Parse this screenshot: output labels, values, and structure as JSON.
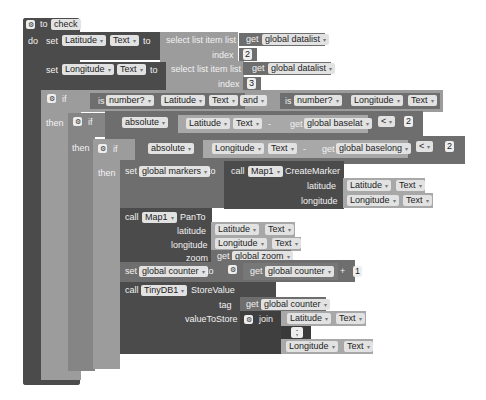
{
  "procedure": {
    "to_label": "to",
    "name": "check",
    "do_label": "do"
  },
  "set_latitude": {
    "set_label": "set",
    "component": "Latitude",
    "property": "Text",
    "to_label": "to",
    "select_label": "select list item  list",
    "get_label": "get",
    "list_var": "global datalist",
    "index_label": "index",
    "index_value": "2"
  },
  "set_longitude": {
    "set_label": "set",
    "component": "Longitude",
    "property": "Text",
    "to_label": "to",
    "select_label": "select list item  list",
    "get_label": "get",
    "list_var": "global datalist",
    "index_label": "index",
    "index_value": "3"
  },
  "if1": {
    "if_label": "if",
    "then_label": "then",
    "is_label": "is",
    "check1": "number?",
    "comp1": "Latitude",
    "prop1": "Text",
    "and_label": "and",
    "check2": "number?",
    "comp2": "Longitude",
    "prop2": "Text"
  },
  "if2": {
    "if_label": "if",
    "then_label": "then",
    "fn": "absolute",
    "comp": "Latitude",
    "prop": "Text",
    "minus": "-",
    "get_label": "get",
    "var": "global baselat",
    "op": "<",
    "value": "2"
  },
  "if3": {
    "if_label": "if",
    "then_label": "then",
    "fn": "absolute",
    "comp": "Longitude",
    "prop": "Text",
    "minus": "-",
    "get_label": "get",
    "var": "global baselong",
    "op": "<",
    "value": "2"
  },
  "set_markers": {
    "set_label": "set",
    "var": "global markers",
    "to_label": "to",
    "call_label": "call",
    "component": "Map1",
    "method": "CreateMarker",
    "lat_label": "latitude",
    "lat_comp": "Latitude",
    "lat_prop": "Text",
    "lon_label": "longitude",
    "lon_comp": "Longitude",
    "lon_prop": "Text"
  },
  "pan": {
    "call_label": "call",
    "component": "Map1",
    "method": "PanTo",
    "lat_label": "latitude",
    "lat_comp": "Latitude",
    "lat_prop": "Text",
    "lon_label": "longitude",
    "lon_comp": "Longitude",
    "lon_prop": "Text",
    "zoom_label": "zoom",
    "get_label": "get",
    "zoom_var": "global zoom"
  },
  "set_counter": {
    "set_label": "set",
    "var": "global counter",
    "to_label": "to",
    "get_label": "get",
    "get_var": "global counter",
    "op": "+",
    "value": "1"
  },
  "store": {
    "call_label": "call",
    "component": "TinyDB1",
    "method": "StoreValue",
    "tag_label": "tag",
    "get_label": "get",
    "tag_var": "global counter",
    "value_label": "valueToStore",
    "join_label": "join",
    "comp1": "Latitude",
    "prop1": "Text",
    "sep": " ; ",
    "comp2": "Longitude",
    "prop2": "Text"
  },
  "dropdown_glyph": "▾",
  "gear_glyph": "⚙"
}
